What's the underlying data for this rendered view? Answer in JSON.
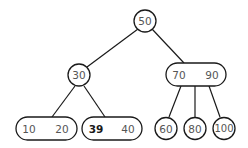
{
  "tree": {
    "type": "2-3 tree",
    "root": {
      "keys": [
        "50"
      ]
    },
    "level1": [
      {
        "keys": [
          "30"
        ]
      },
      {
        "keys": [
          "70",
          "90"
        ]
      }
    ],
    "leaves": [
      {
        "keys": [
          "10",
          "20"
        ]
      },
      {
        "keys": [
          "39",
          "40"
        ],
        "highlighted_key": "39"
      },
      {
        "keys": [
          "60"
        ]
      },
      {
        "keys": [
          "80"
        ]
      },
      {
        "keys": [
          "100"
        ]
      }
    ]
  }
}
